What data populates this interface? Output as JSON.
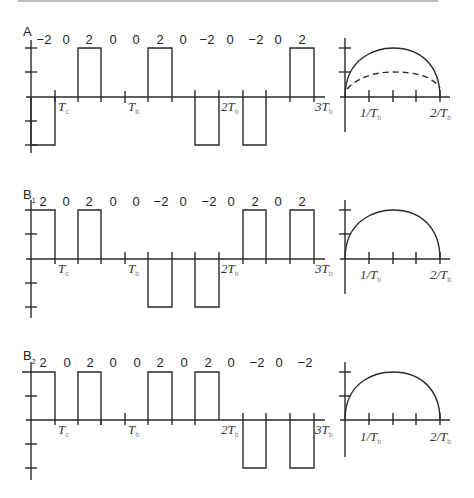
{
  "panels": [
    {
      "id": "A",
      "label": "A",
      "codes": [
        "−2",
        "0",
        "2",
        "0",
        "0",
        "2",
        "0",
        "−2",
        "0",
        "−2",
        "0",
        "2"
      ],
      "time_labels": {
        "tc": "T",
        "tc_sub": "c",
        "tb": "T",
        "tb_sub": "b",
        "t2": "2T",
        "t2_sub": "b",
        "t3": "3T",
        "t3_sub": "b"
      },
      "spectrum": {
        "x1": "1/T",
        "x1_sub": "b",
        "x2": "2/T",
        "x2_sub": "b",
        "dashed_curve": true
      }
    },
    {
      "id": "B1",
      "label": "B",
      "label_sub": "1",
      "codes": [
        "2",
        "0",
        "2",
        "0",
        "0",
        "−2",
        "0",
        "−2",
        "0",
        "2",
        "0",
        "2"
      ],
      "time_labels": {
        "tc": "T",
        "tc_sub": "c",
        "tb": "T",
        "tb_sub": "b",
        "t2": "2T",
        "t2_sub": "b",
        "t3": "3T",
        "t3_sub": "b"
      },
      "spectrum": {
        "x1": "1/T",
        "x1_sub": "b",
        "x2": "2/T",
        "x2_sub": "b",
        "dashed_curve": false
      }
    },
    {
      "id": "B2",
      "label": "B",
      "label_sub": "2",
      "codes": [
        "2",
        "0",
        "2",
        "0",
        "0",
        "2",
        "0",
        "2",
        "0",
        "−2",
        "0",
        "−2"
      ],
      "time_labels": {
        "tc": "T",
        "tc_sub": "c",
        "tb": "T",
        "tb_sub": "b",
        "t2": "2T",
        "t2_sub": "b",
        "t3": "3T",
        "t3_sub": "b"
      },
      "spectrum": {
        "x1": "1/T",
        "x1_sub": "b",
        "x2": "2/T",
        "x2_sub": "b",
        "dashed_curve": false
      }
    }
  ]
}
